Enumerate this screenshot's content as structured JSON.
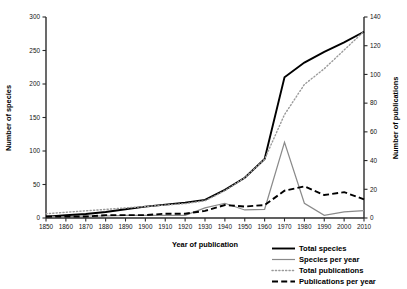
{
  "chart_data": {
    "type": "line",
    "title": "",
    "xlabel": "Year of publication",
    "ylabel": "Number of species",
    "ylabel_right": "Number of publications",
    "grid": false,
    "legend_position": "bottom-right",
    "xlim": [
      1850,
      2010
    ],
    "ylim": [
      0,
      300
    ],
    "ylim_right": [
      0,
      140
    ],
    "xticks": [
      1850,
      1860,
      1870,
      1880,
      1890,
      1900,
      1910,
      1920,
      1930,
      1940,
      1950,
      1960,
      1970,
      1980,
      1990,
      2000,
      2010
    ],
    "yticks": [
      0,
      50,
      100,
      150,
      200,
      250,
      300
    ],
    "yticks_right": [
      0,
      20,
      40,
      60,
      80,
      100,
      120,
      140
    ],
    "x": [
      1850,
      1860,
      1870,
      1880,
      1890,
      1900,
      1910,
      1920,
      1930,
      1940,
      1950,
      1960,
      1970,
      1980,
      1990,
      2000,
      2010
    ],
    "series": [
      {
        "name": "Total species",
        "axis": "left",
        "style": "solid-thick-black",
        "color": "#000000",
        "values": [
          2,
          4,
          6,
          9,
          13,
          17,
          20,
          23,
          27,
          42,
          60,
          88,
          210,
          232,
          248,
          262,
          278
        ]
      },
      {
        "name": "Species per year",
        "axis": "left",
        "style": "solid-thin-gray",
        "color": "#8a8a8a",
        "values": [
          2,
          2,
          3,
          3,
          4,
          4,
          4,
          4,
          15,
          22,
          12,
          13,
          113,
          22,
          4,
          9,
          11
        ]
      },
      {
        "name": "Total publications",
        "axis": "right",
        "style": "dotted-gray",
        "color": "#9a9a9a",
        "values": [
          3,
          4,
          5,
          6,
          7,
          8,
          9,
          10,
          12,
          19,
          28,
          41,
          72,
          93,
          104,
          117,
          130
        ]
      },
      {
        "name": "Publications per year",
        "axis": "right",
        "style": "dashed-black",
        "color": "#000000",
        "values": [
          1,
          1,
          1,
          2,
          2,
          2,
          3,
          3,
          5,
          9,
          8,
          9,
          19,
          22,
          16,
          18,
          13
        ]
      }
    ]
  },
  "legend": {
    "items": [
      {
        "label": "Total species"
      },
      {
        "label": "Species per year"
      },
      {
        "label": "Total publications"
      },
      {
        "label": "Publications per year"
      }
    ]
  }
}
